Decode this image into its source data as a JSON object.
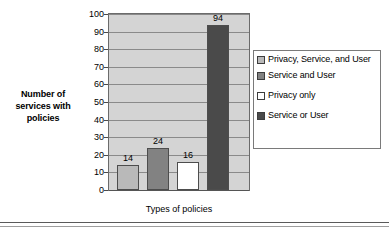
{
  "chart_data": {
    "type": "bar",
    "title": "",
    "subtitle": "",
    "xlabel": "Types of policies",
    "ylabel": "Number of services with policies",
    "categories": [
      "Privacy, Service, and User",
      "Service and User",
      "Privacy only",
      "Service or User"
    ],
    "values": [
      14,
      24,
      16,
      94
    ],
    "data_labels": [
      "14",
      "24",
      "16",
      "94"
    ],
    "ylim": [
      0,
      100
    ],
    "ytick_values": [
      0,
      10,
      20,
      30,
      40,
      50,
      60,
      70,
      80,
      90,
      100
    ],
    "ytick_labels": [
      "0",
      "10",
      "20",
      "30",
      "40",
      "50",
      "60",
      "70",
      "80",
      "90",
      "100"
    ],
    "grid": true,
    "grid_axis": "y",
    "legend_position": "right",
    "series": [
      {
        "name": "Privacy, Service, and User",
        "value": 14,
        "color": "#b9b9b9"
      },
      {
        "name": "Service and User",
        "value": 24,
        "color": "#828282"
      },
      {
        "name": "Privacy only",
        "value": 16,
        "color": "#ffffff"
      },
      {
        "name": "Service or User",
        "value": 94,
        "color": "#4a4a4a"
      }
    ],
    "plot_background": "#d4d4d4",
    "gridline_color": "#8a8a8a",
    "border_color": "#6b6b6b"
  },
  "axes": {
    "y_title": "Number of services with policies",
    "x_title": "Types of policies"
  },
  "legend": {
    "items": [
      {
        "label": "Privacy, Service, and User",
        "swatch": "#b9b9b9"
      },
      {
        "label": "Service and User",
        "swatch": "#828282"
      },
      {
        "label": "Privacy only",
        "swatch": "#ffffff"
      },
      {
        "label": "Service or User",
        "swatch": "#4a4a4a"
      }
    ]
  }
}
